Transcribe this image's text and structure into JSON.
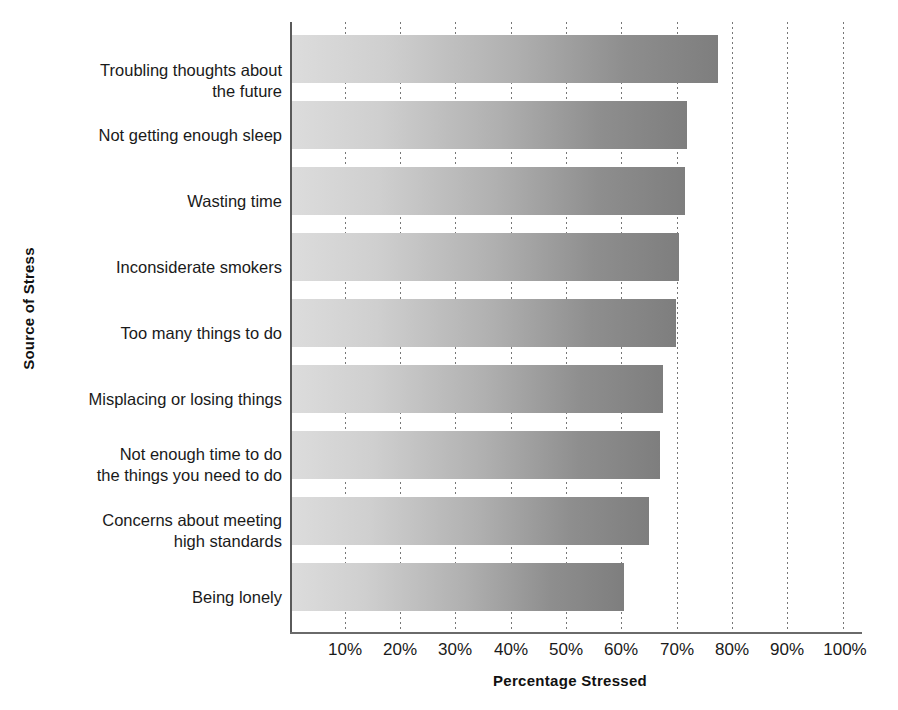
{
  "chart_data": {
    "type": "bar",
    "orientation": "horizontal",
    "title": "",
    "xlabel": "Percentage  Stressed",
    "ylabel": "Source of Stress",
    "categories": [
      "Troubling thoughts about\nthe future",
      "Not getting enough sleep",
      "Wasting time",
      "Inconsiderate smokers",
      "Too many things to do",
      "Misplacing or losing things",
      "Not enough time to do\nthe things you need to do",
      "Concerns about meeting\nhigh standards",
      "Being lonely"
    ],
    "values": [
      77,
      71.5,
      71,
      70,
      69.5,
      67,
      66.5,
      64.5,
      60
    ],
    "value_unit": "%",
    "xlim": [
      0,
      100
    ],
    "xticks": [
      10,
      20,
      30,
      40,
      50,
      60,
      70,
      80,
      90,
      100
    ],
    "xticklabels": [
      "10%",
      "20%",
      "30%",
      "40%",
      "50%",
      "60%",
      "70%",
      "80%",
      "90%",
      "100%"
    ],
    "grid": "vertical-dotted",
    "legend": "none",
    "bar_fill": "gradient light-gray to medium-gray",
    "colors": {
      "bar_start": "#dcdcdc",
      "bar_end": "#7e7e7e",
      "axis": "#5a5a5a",
      "gridline": "#777777",
      "text": "#1a1a1a",
      "background": "#ffffff"
    }
  }
}
